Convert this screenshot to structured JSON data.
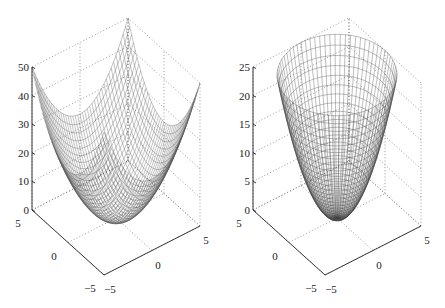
{
  "chart_data": [
    {
      "type": "surface-mesh",
      "title": "",
      "function": "z = x^2 + y^2 (square domain)",
      "x_range": [
        -5,
        5
      ],
      "y_range": [
        -5,
        5
      ],
      "zlim": [
        0,
        50
      ],
      "x_ticks": [
        -5,
        0,
        5
      ],
      "y_ticks": [
        -5,
        0,
        5
      ],
      "z_ticks": [
        0,
        10,
        20,
        30,
        40,
        50
      ],
      "grid": true,
      "projection": {
        "origin_x": 104,
        "origin_y": 275,
        "xmax_dx": 96,
        "xmax_dy": -49,
        "ymax_dx": -72,
        "ymax_dy": -65,
        "zmax_dy": -143
      },
      "mesh_color": "#555555"
    },
    {
      "type": "surface-mesh",
      "title": "",
      "function": "z = x^2 + y^2 (circular domain, r <= 5)",
      "x_range": [
        -5,
        5
      ],
      "y_range": [
        -5,
        5
      ],
      "zlim": [
        0,
        25
      ],
      "x_ticks": [
        -5,
        0,
        5
      ],
      "y_ticks": [
        -5,
        0,
        5
      ],
      "z_ticks": [
        0,
        5,
        10,
        15,
        20,
        25
      ],
      "grid": true,
      "projection": {
        "origin_x": 325,
        "origin_y": 275,
        "xmax_dx": 96,
        "xmax_dy": -49,
        "ymax_dx": -72,
        "ymax_dy": -65,
        "zmax_dy": -143
      },
      "mesh_color": "#444444"
    }
  ]
}
